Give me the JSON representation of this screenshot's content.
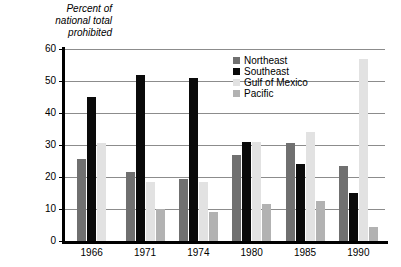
{
  "chart_data": {
    "type": "bar",
    "xlabel": "",
    "ylabel": "Percent of national total prohibited",
    "ylim": [
      0,
      60
    ],
    "yticks": [
      0,
      10,
      20,
      30,
      40,
      50,
      60
    ],
    "grid": true,
    "legend_position": "inside-top-right",
    "categories": [
      "1966",
      "1971",
      "1974",
      "1980",
      "1985",
      "1990"
    ],
    "series": [
      {
        "name": "Northeast",
        "color": "#707070",
        "values": [
          25.5,
          21.5,
          19.5,
          27.0,
          30.5,
          23.5
        ]
      },
      {
        "name": "Southeast",
        "color": "#0a0a0a",
        "values": [
          45.0,
          52.0,
          51.0,
          31.0,
          24.0,
          15.0
        ]
      },
      {
        "name": "Gulf of Mexico",
        "color": "#e2e2e2",
        "values": [
          30.5,
          18.5,
          18.5,
          31.0,
          34.0,
          57.0
        ]
      },
      {
        "name": "Pacific",
        "color": "#b2b2b2",
        "values": [
          null,
          10.0,
          9.0,
          11.5,
          12.5,
          4.5
        ]
      }
    ]
  },
  "axis": {
    "title_line1": "Percent of",
    "title_line2": "national total",
    "title_line3": "prohibited",
    "y_ticks": [
      "60",
      "50",
      "40",
      "30",
      "20",
      "10",
      "0"
    ],
    "x_ticks": [
      "1966",
      "1971",
      "1974",
      "1980",
      "1985",
      "1990"
    ]
  },
  "legend": {
    "items": [
      {
        "label": "Northeast"
      },
      {
        "label": "Southeast"
      },
      {
        "label": "Gulf of Mexico"
      },
      {
        "label": "Pacific"
      }
    ]
  }
}
